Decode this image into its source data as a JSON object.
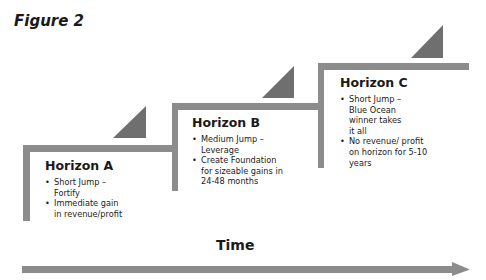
{
  "figure": {
    "title": "Figure 2"
  },
  "horizons": [
    {
      "title": "Horizon A",
      "bullets": [
        "Short Jump – Fortify",
        "Immediate gain in revenue/profit"
      ]
    },
    {
      "title": "Horizon B",
      "bullets": [
        "Medium Jump – Leverage",
        "Create Foundation for sizeable gains in 24-48 months"
      ]
    },
    {
      "title": "Horizon C",
      "bullets": [
        "Short Jump – Blue Ocean winner takes it all",
        "No revenue/ profit on horizon for 5-10 years"
      ]
    }
  ],
  "axis": {
    "label": "Time"
  },
  "colors": {
    "line": "#8c8c8c",
    "triangle": "#6f6f6f",
    "text": "#1a1a1a"
  }
}
